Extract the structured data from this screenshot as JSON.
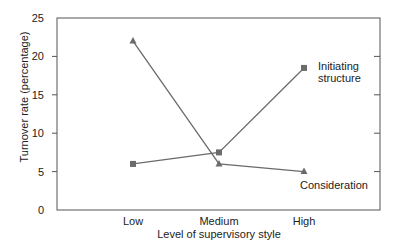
{
  "chart_data": {
    "type": "line",
    "title": "",
    "xlabel": "Level of supervisory style",
    "ylabel": "Turnover rate (percentage)",
    "categories": [
      "Low",
      "Medium",
      "High"
    ],
    "ylim": [
      0,
      25
    ],
    "yticks": [
      0,
      5,
      10,
      15,
      20,
      25
    ],
    "grid": false,
    "legend": "inline labels at line ends",
    "series": [
      {
        "name": "Initiating structure",
        "marker": "square",
        "values": [
          6,
          7.5,
          18.5
        ]
      },
      {
        "name": "Consideration",
        "marker": "triangle",
        "values": [
          22,
          6,
          5
        ]
      }
    ]
  },
  "labels": {
    "series_initiating_line1": "Initiating",
    "series_initiating_line2": "structure",
    "series_consideration": "Consideration"
  },
  "colors": {
    "line": "#6b6b6b",
    "axis": "#555555",
    "text": "#222222"
  }
}
